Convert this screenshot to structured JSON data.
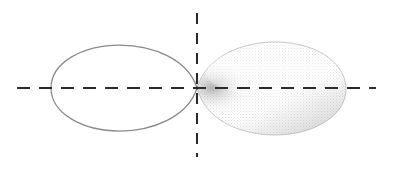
{
  "figure": {
    "title": "p-orbital",
    "description": "Two-lobed p atomic orbital with a nodal plane at the nucleus",
    "background_color": "#ffffff",
    "width": 405,
    "height": 184
  },
  "axes": {
    "horizontal": {
      "name": "horizontal-axis",
      "style": "dashed",
      "color": "#2b2b2b",
      "y": 88,
      "x_start": 17,
      "x_end": 376,
      "dash_pattern": "13 9"
    },
    "vertical": {
      "name": "vertical-axis",
      "style": "dashed",
      "color": "#2b2b2b",
      "x": 197,
      "y_start": 13,
      "y_end": 157,
      "dash_pattern": "11 9"
    },
    "origin": {
      "x": 197,
      "y": 88,
      "label": "node"
    }
  },
  "lobes": [
    {
      "name": "left-lobe",
      "fill": "none",
      "fill_color": "#ffffff",
      "stroke_color": "#8a8a8a",
      "stroke_width": 1.25,
      "tip_x": 197,
      "extent_x": 51,
      "top_y": 45,
      "bottom_y": 131,
      "sign": "negative"
    },
    {
      "name": "right-lobe",
      "fill": "shaded",
      "fill_color_light": "#f2f2f2",
      "fill_color_mid": "#d8d8d8",
      "fill_color_dark": "#b4b4b4",
      "stroke_color": "#c9c9c9",
      "stroke_width": 1.0,
      "tip_x": 197,
      "extent_x": 346,
      "top_y": 42,
      "bottom_y": 136,
      "sign": "positive",
      "texture": "halftone-dither"
    }
  ],
  "colors": {
    "axis": "#2b2b2b",
    "outline": "#8a8a8a",
    "shade_light": "#f2f2f2",
    "shade_dark": "#b4b4b4",
    "background": "#ffffff"
  }
}
